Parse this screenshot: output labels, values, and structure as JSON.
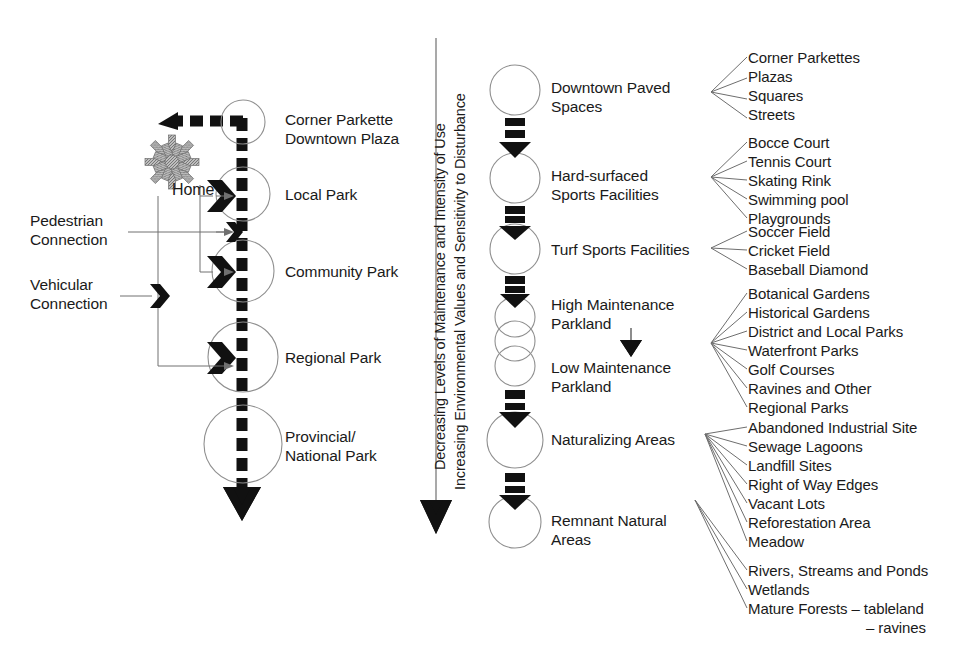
{
  "diagram": {
    "axis": {
      "line1": "Decreasing Levels of Maintenance and Intensity of Use",
      "line2": "Increasing Environmental Values and Sensitivity to Disturbance",
      "direction": "down"
    },
    "left_column": {
      "home_label": "Home",
      "connection_labels": [
        {
          "line1": "Pedestrian",
          "line2": "Connection"
        },
        {
          "line1": "Vehicular",
          "line2": "Connection"
        }
      ],
      "nodes": [
        {
          "line1": "Corner Parkette",
          "line2": "Downtown Plaza"
        },
        {
          "line1": "Local Park",
          "line2": ""
        },
        {
          "line1": "Community Park",
          "line2": ""
        },
        {
          "line1": "Regional Park",
          "line2": ""
        },
        {
          "line1": "Provincial/",
          "line2": "National Park"
        }
      ]
    },
    "middle_column": {
      "nodes": [
        {
          "line1": "Downtown Paved",
          "line2": "Spaces"
        },
        {
          "line1": "Hard-surfaced",
          "line2": "Sports Facilities"
        },
        {
          "line1": "Turf Sports Facilities",
          "line2": ""
        },
        {
          "line1": "High Maintenance",
          "line2": "Parkland"
        },
        {
          "line1": "Low Maintenance",
          "line2": "Parkland"
        },
        {
          "line1": "Naturalizing Areas",
          "line2": ""
        },
        {
          "line1": "Remnant Natural",
          "line2": "Areas"
        }
      ]
    },
    "right_lists": [
      {
        "group": "Downtown Paved Spaces",
        "items": [
          "Corner Parkettes",
          "Plazas",
          "Squares",
          "Streets"
        ]
      },
      {
        "group": "Hard-surfaced Sports Facilities",
        "items": [
          "Bocce Court",
          "Tennis Court",
          "Skating Rink",
          "Swimming pool",
          "Playgrounds"
        ]
      },
      {
        "group": "Turf Sports Facilities",
        "items": [
          "Soccer Field",
          "Cricket Field",
          "Baseball Diamond"
        ]
      },
      {
        "group": "Maintenance Parkland",
        "items": [
          "Botanical Gardens",
          "Historical Gardens",
          "District and Local Parks",
          "Waterfront Parks",
          "Golf Courses",
          "Ravines and Other",
          "Regional Parks"
        ]
      },
      {
        "group": "Naturalizing Areas",
        "items": [
          "Abandoned Industrial Site",
          "Sewage Lagoons",
          "Landfill Sites",
          "Right of Way Edges",
          "Vacant Lots",
          "Reforestation Area",
          "Meadow"
        ]
      },
      {
        "group": "Remnant Natural Areas",
        "items": [
          "Rivers, Streams and Ponds",
          "Wetlands",
          "Mature Forests – tableland",
          "– ravines"
        ]
      }
    ],
    "colors": {
      "ink": "#1a1a1a",
      "circle_stroke": "#8a8a8a",
      "hairline": "#6e6e6e",
      "home_icon": "#9a9a9a",
      "background": "#ffffff"
    }
  }
}
